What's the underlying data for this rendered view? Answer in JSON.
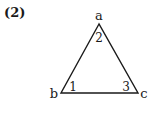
{
  "figure": {
    "label": "(2)",
    "shape": "triangle",
    "stroke_color": "#1a1a1a",
    "vertices": [
      {
        "name": "a",
        "x": 99,
        "y": 24,
        "label_x": 99,
        "label_y": 20
      },
      {
        "name": "b",
        "x": 61,
        "y": 93,
        "label_x": 54,
        "label_y": 97
      },
      {
        "name": "c",
        "x": 138,
        "y": 93,
        "label_x": 144,
        "label_y": 97
      }
    ],
    "angles": [
      {
        "number": "1",
        "vertex": "b",
        "x": 73,
        "y": 91
      },
      {
        "number": "2",
        "vertex": "a",
        "x": 99,
        "y": 41
      },
      {
        "number": "3",
        "vertex": "c",
        "x": 126,
        "y": 91
      }
    ]
  }
}
